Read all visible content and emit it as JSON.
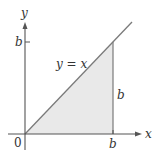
{
  "diagram": {
    "colors": {
      "axis": "#555555",
      "line": "#7a7a7a",
      "fill": "#e9e9e9",
      "text": "#333333"
    },
    "axes": {
      "x_label": "x",
      "y_label": "y",
      "origin_label": "0"
    },
    "ticks": {
      "x_tick_label": "b",
      "y_tick_label": "b"
    },
    "line_label": "y = x",
    "side_label": "b",
    "region": {
      "shape": "triangle",
      "vertices": [
        [
          "0",
          "0"
        ],
        [
          "b",
          "0"
        ],
        [
          "b",
          "b"
        ]
      ]
    }
  }
}
